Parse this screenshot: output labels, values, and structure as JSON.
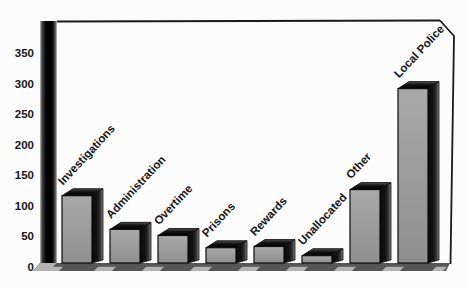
{
  "figure": {
    "background": "#fcfcfc"
  },
  "chart_data": {
    "type": "bar",
    "style": "3d-block-bars",
    "title": "",
    "xlabel": "",
    "ylabel": "",
    "categories": [
      "Investigations",
      "Administration",
      "Overtime",
      "Prisons",
      "Rewards",
      "Unallocated",
      "Other",
      "Local Police"
    ],
    "values": [
      110,
      55,
      45,
      25,
      27,
      12,
      120,
      285
    ],
    "yticks": [
      0,
      50,
      100,
      150,
      200,
      250,
      300,
      350
    ],
    "ylim": [
      0,
      390
    ],
    "grid": false,
    "legend": false,
    "category_label_rotation_deg": -47,
    "colors": {
      "background": "#fcfcfc",
      "bar_front": "#9c9c9c",
      "bar_front_light": "#a8a8a8",
      "bar_front_dark": "#8f8f8f",
      "bar_top_front": "#000000",
      "bar_top_back": "#4f4f4f",
      "bar_side_dark": "#080808",
      "bar_side_edge": "#8f8f8f",
      "bar_outline": "#0d0d0d",
      "axis_pillar_dark": "#000000",
      "axis_pillar_edge": "#b8b8b8",
      "floor": "#565656",
      "floor_bevel": "#b3b3b3",
      "frame_line": "#1a1a1a",
      "text": "#161616"
    }
  }
}
